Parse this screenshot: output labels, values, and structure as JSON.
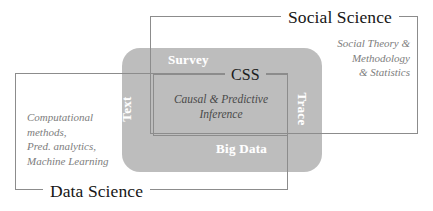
{
  "diagram": {
    "core": {
      "labels": {
        "top": "Survey",
        "bottom": "Big Data",
        "left": "Text",
        "right": "Trace"
      },
      "color": "#bdbdbd"
    },
    "boxes": {
      "social_science": {
        "heading": "Social Science",
        "description": "Social Theory &\nMethodology\n& Statistics",
        "border_color": "#8c8c8c"
      },
      "data_science": {
        "heading": "Data Science",
        "description": "Computational\nmethods,\nPred. analytics,\nMachine Learning",
        "border_color": "#8c8c8c"
      },
      "css": {
        "heading": "CSS",
        "description": "Causal & Predictive\nInference",
        "border_color": "#8c8c8c"
      }
    }
  }
}
